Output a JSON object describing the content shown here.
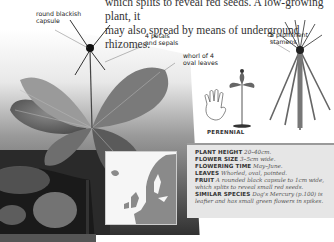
{
  "intro_text": {
    "line1": "which splits to reveal red seeds. A low-growing plant, it",
    "line2": "may also spread by means of underground rhizomes."
  },
  "callouts": [
    {
      "id": "capsule",
      "line1": "round blackish",
      "line2": "capsule"
    },
    {
      "id": "petals",
      "line1": "4 petals",
      "line2": "and sepals"
    },
    {
      "id": "stamens",
      "line1": "8 prominent",
      "line2": "stamens"
    },
    {
      "id": "leaves",
      "line1": "whorl of 4",
      "line2": "oval leaves"
    }
  ],
  "lifecycle": {
    "label": "PERENNIAL",
    "icon": "hand-icon"
  },
  "facts": [
    {
      "key": "PLANT HEIGHT",
      "value": "20–40cm."
    },
    {
      "key": "FLOWER SIZE",
      "value": "3–5cm wide."
    },
    {
      "key": "FLOWERING TIME",
      "value": "May–June."
    },
    {
      "key": "LEAVES",
      "value": "Whorled, oval, pointed."
    },
    {
      "key": "FRUIT",
      "value": "A rounded black capsule to 1cm wide,"
    },
    {
      "key": "",
      "value": "which splits to reveal small red seeds."
    },
    {
      "key": "SIMILAR SPECIES",
      "value": "Dog's Mercury (p.100) is"
    },
    {
      "key": "",
      "value": "leafier and has small green flowers in spikes."
    }
  ],
  "map": {
    "label": "europe-distribution-map"
  },
  "colors": {
    "factbox_bg": "#e6e6e6",
    "factbox_rule": "#9a9a9a",
    "text": "#333333"
  }
}
